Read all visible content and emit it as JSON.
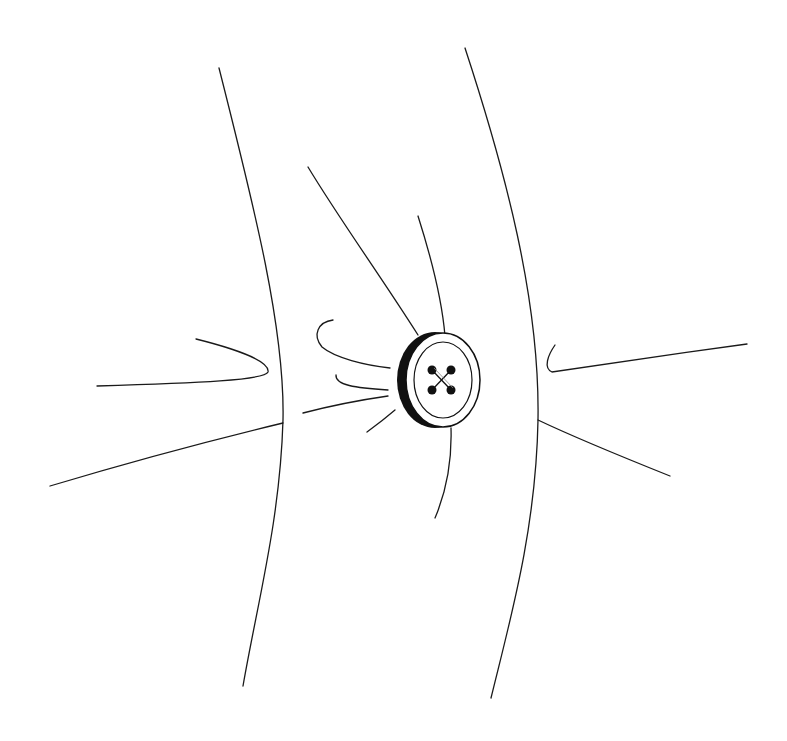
{
  "illustration": {
    "subject": "sewn button on fabric with tension lines",
    "stroke_color": "#1a1a1a",
    "background_color": "#ffffff",
    "button": {
      "center": [
        441,
        380
      ],
      "holes": 4,
      "stitch": "cross"
    }
  }
}
